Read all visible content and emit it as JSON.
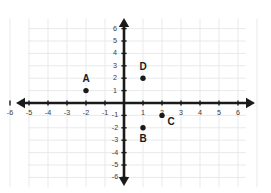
{
  "chart_data": {
    "type": "scatter",
    "title": "",
    "xlabel": "",
    "ylabel": "",
    "xlim": [
      -6.8,
      6.8
    ],
    "ylim": [
      -6.6,
      6.6
    ],
    "grid": true,
    "legend": "none",
    "x_ticks": [
      -6,
      -5,
      -4,
      -3,
      -2,
      -1,
      1,
      2,
      3,
      4,
      5,
      6
    ],
    "y_ticks": [
      6,
      5,
      4,
      3,
      2,
      1,
      -1,
      -2,
      -3,
      -4,
      -5,
      -6
    ],
    "x_tick_labels": [
      "-6",
      "-5",
      "-4",
      "-3",
      "-2",
      "-1",
      "1",
      "2",
      "3",
      "4",
      "5",
      "6"
    ],
    "y_tick_labels": [
      "6",
      "5",
      "4",
      "3",
      "2",
      "1",
      "-1",
      "-2",
      "-3",
      "-4",
      "-5",
      "-6"
    ],
    "points": [
      {
        "label": "A",
        "x": -2,
        "y": 1,
        "label_dx": 0,
        "label_dy": -11
      },
      {
        "label": "B",
        "x": 1,
        "y": -2,
        "label_dx": 0,
        "label_dy": 12
      },
      {
        "label": "C",
        "x": 2,
        "y": -1,
        "label_dx": 9,
        "label_dy": 7
      },
      {
        "label": "D",
        "x": 1,
        "y": 2,
        "label_dx": 0,
        "label_dy": -11
      }
    ],
    "colors": {
      "point": "#1a1a1a",
      "axis": "#1a1a1a",
      "grid": "#e8e9ec",
      "tick_label": "#3a3a3a",
      "background": "#ffffff"
    }
  },
  "figure": {
    "caption": "Coordinate plane with plotted points A, B, C and D"
  }
}
